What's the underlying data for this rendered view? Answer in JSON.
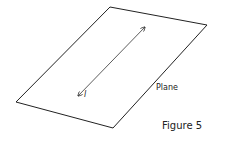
{
  "diagram": {
    "plane_label": "Plane",
    "line_label": "l",
    "caption": "Figure 5",
    "colors": {
      "stroke": "#222222",
      "background": "#ffffff"
    }
  }
}
